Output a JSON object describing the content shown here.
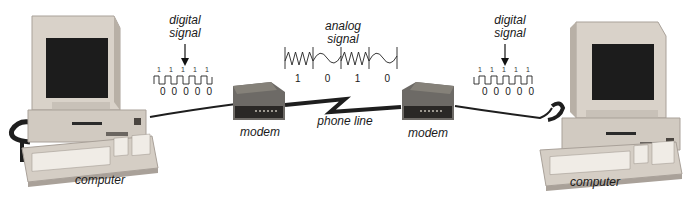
{
  "diagram": {
    "nodes": {
      "left_computer": {
        "label": "computer"
      },
      "left_modem": {
        "label": "modem"
      },
      "right_modem": {
        "label": "modem"
      },
      "right_computer": {
        "label": "computer"
      }
    },
    "link": {
      "label": "phone line"
    },
    "left_digital_signal": {
      "label_line1": "digital",
      "label_line2": "signal",
      "top_bits": [
        "1",
        "1",
        "1",
        "1",
        "1"
      ],
      "bottom_bits": [
        "0",
        "0",
        "0",
        "0",
        "0"
      ]
    },
    "analog_signal": {
      "label_line1": "analog",
      "label_line2": "signal",
      "bits": [
        "1",
        "0",
        "1",
        "0"
      ]
    },
    "right_digital_signal": {
      "label_line1": "digital",
      "label_line2": "signal",
      "top_bits": [
        "1",
        "1",
        "1",
        "1",
        "1"
      ],
      "bottom_bits": [
        "0",
        "0",
        "0",
        "0",
        "0"
      ]
    },
    "colors": {
      "casing": "#d9d2c9",
      "casing_shadow": "#a9a199",
      "screen": "#1c1c1c",
      "modem_body": "#6d6a66",
      "cable": "#1e1e1e"
    }
  }
}
